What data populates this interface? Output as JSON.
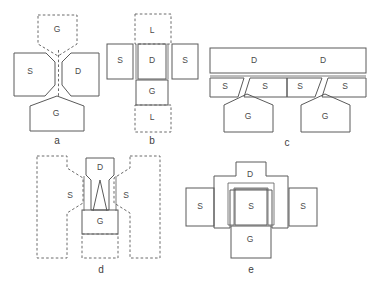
{
  "figure": {
    "background_color": "#ffffff",
    "stroke_color": "#5a5a5a",
    "label_color": "#4a4a4a",
    "panel_label_color": "#3d3d3d"
  },
  "panels": [
    {
      "id": "a",
      "label": "a",
      "label_x": 57,
      "label_y": 141,
      "regions": [
        {
          "name": "gate-top",
          "text": "G",
          "x": 57,
          "y": 30,
          "style": "dashed"
        },
        {
          "name": "source-left",
          "text": "S",
          "x": 30,
          "y": 72,
          "style": "solid"
        },
        {
          "name": "drain-right",
          "text": "D",
          "x": 78,
          "y": 72,
          "style": "solid"
        },
        {
          "name": "gate-bottom",
          "text": "G",
          "x": 56,
          "y": 114,
          "style": "solid"
        }
      ]
    },
    {
      "id": "b",
      "label": "b",
      "label_x": 152,
      "label_y": 141,
      "regions": [
        {
          "name": "layer-top",
          "text": "L",
          "x": 152,
          "y": 31,
          "style": "dashed"
        },
        {
          "name": "source-left",
          "text": "S",
          "x": 120,
          "y": 60,
          "style": "solid"
        },
        {
          "name": "drain-center",
          "text": "D",
          "x": 152,
          "y": 61,
          "style": "solid"
        },
        {
          "name": "source-right",
          "text": "S",
          "x": 185,
          "y": 60,
          "style": "solid"
        },
        {
          "name": "gate-center",
          "text": "G",
          "x": 152,
          "y": 92,
          "style": "solid"
        },
        {
          "name": "layer-bottom",
          "text": "L",
          "x": 152,
          "y": 118,
          "style": "dashed"
        }
      ]
    },
    {
      "id": "c",
      "label": "c",
      "label_x": 287,
      "label_y": 143,
      "regions": [
        {
          "name": "drain-bar-left",
          "text": "D",
          "x": 254,
          "y": 61,
          "style": "solid"
        },
        {
          "name": "drain-bar-right",
          "text": "D",
          "x": 323,
          "y": 61,
          "style": "solid"
        },
        {
          "name": "source-1",
          "text": "S",
          "x": 227,
          "y": 86,
          "style": "solid"
        },
        {
          "name": "source-2",
          "text": "S",
          "x": 270,
          "y": 86,
          "style": "solid"
        },
        {
          "name": "source-3",
          "text": "S",
          "x": 303,
          "y": 86,
          "style": "solid"
        },
        {
          "name": "source-4",
          "text": "S",
          "x": 348,
          "y": 86,
          "style": "solid"
        },
        {
          "name": "gate-left",
          "text": "G",
          "x": 248,
          "y": 117,
          "style": "solid"
        },
        {
          "name": "gate-right",
          "text": "G",
          "x": 325,
          "y": 117,
          "style": "solid"
        }
      ]
    },
    {
      "id": "d",
      "label": "d",
      "label_x": 101,
      "label_y": 270,
      "regions": [
        {
          "name": "drain-top",
          "text": "D",
          "x": 100,
          "y": 168,
          "style": "solid"
        },
        {
          "name": "source-left",
          "text": "S",
          "x": 70,
          "y": 196,
          "style": "solid"
        },
        {
          "name": "source-right",
          "text": "S",
          "x": 125,
          "y": 196,
          "style": "solid"
        },
        {
          "name": "gate-bottom",
          "text": "G",
          "x": 100,
          "y": 221,
          "style": "solid"
        }
      ]
    },
    {
      "id": "e",
      "label": "e",
      "label_x": 251,
      "label_y": 270,
      "regions": [
        {
          "name": "drain-outer",
          "text": "D",
          "x": 250,
          "y": 175,
          "style": "solid"
        },
        {
          "name": "source-left",
          "text": "S",
          "x": 200,
          "y": 206,
          "style": "solid"
        },
        {
          "name": "source-center",
          "text": "S",
          "x": 251,
          "y": 206,
          "style": "solid"
        },
        {
          "name": "source-right",
          "text": "S",
          "x": 303,
          "y": 206,
          "style": "solid"
        },
        {
          "name": "gate-bottom",
          "text": "G",
          "x": 249,
          "y": 240,
          "style": "solid"
        }
      ]
    }
  ]
}
